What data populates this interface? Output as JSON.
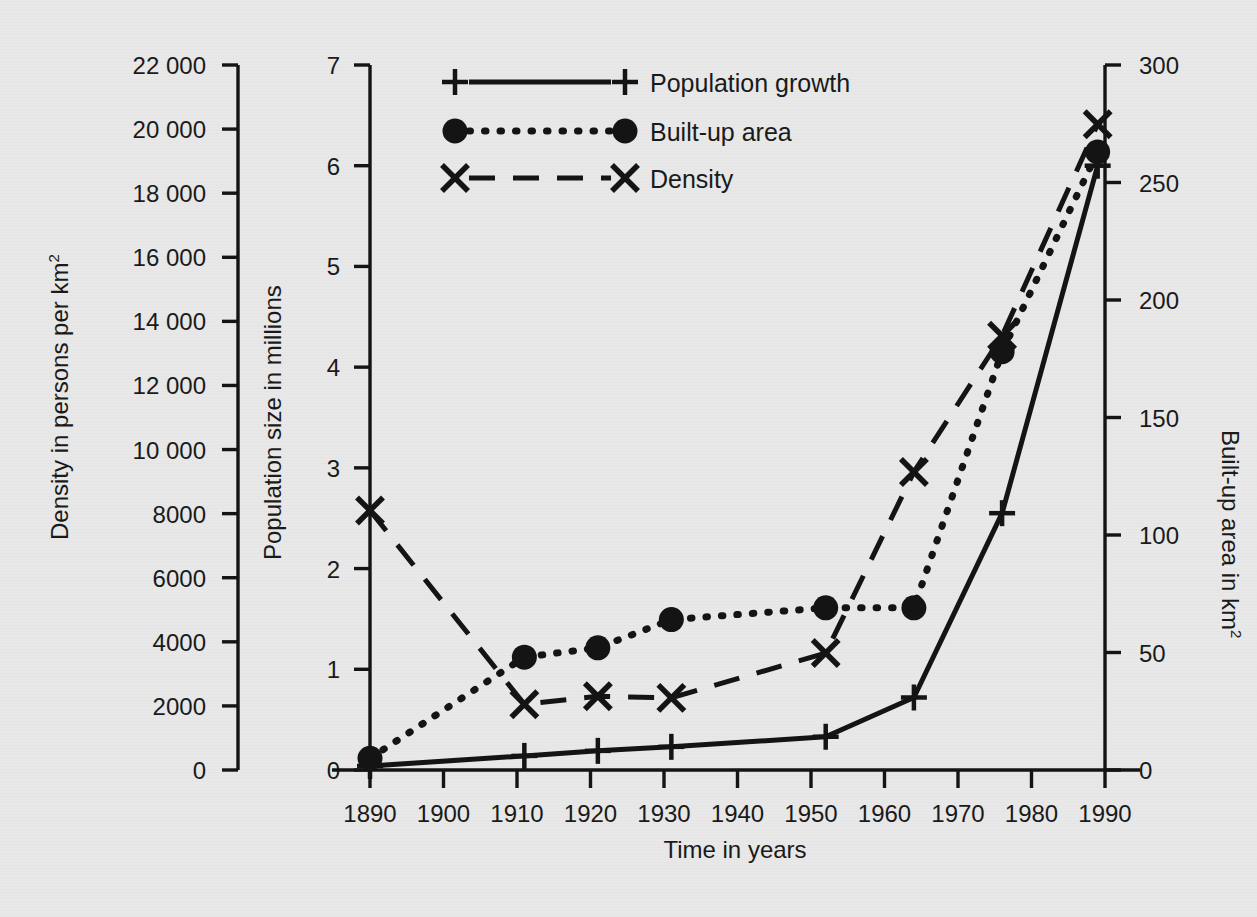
{
  "chart_data": {
    "type": "line",
    "title": "",
    "xlabel": "Time in years",
    "xlim": [
      1890,
      1990
    ],
    "xticks": [
      1890,
      1900,
      1910,
      1920,
      1930,
      1940,
      1950,
      1960,
      1970,
      1980,
      1990
    ],
    "xticklabels": [
      "1890",
      "1900",
      "1910",
      "1920",
      "1930",
      "1940",
      "1950",
      "1960",
      "1970",
      "1980",
      "1990"
    ],
    "grid": false,
    "legend_position": "top-center",
    "axes": [
      {
        "id": "density-axis",
        "position": "outer-left",
        "label_lines": [
          "Density in persons per km"
        ],
        "label_superscript": "2",
        "ylabel": "Density in persons per km²",
        "ylim": [
          0,
          22000
        ],
        "ytick_step": 2000,
        "yticks": [
          0,
          2000,
          4000,
          6000,
          8000,
          10000,
          12000,
          14000,
          16000,
          18000,
          20000,
          22000
        ],
        "yticklabels": [
          "0",
          "2000",
          "4000",
          "6000",
          "8000",
          "10 000",
          "12 000",
          "14 000",
          "16 000",
          "18 000",
          "20 000",
          "22 000"
        ]
      },
      {
        "id": "population-axis",
        "position": "inner-left",
        "ylabel": "Population size in millions",
        "ylim": [
          0,
          7
        ],
        "ytick_step": 1,
        "yticks": [
          0,
          1,
          2,
          3,
          4,
          5,
          6,
          7
        ],
        "yticklabels": [
          "0",
          "1",
          "2",
          "3",
          "4",
          "5",
          "6",
          "7"
        ]
      },
      {
        "id": "builtup-axis",
        "position": "right",
        "label_lines": [
          "Built-up area in km"
        ],
        "label_superscript": "2",
        "ylabel": "Built-up area in km²",
        "ylim": [
          0,
          300
        ],
        "ytick_step": 50,
        "yticks": [
          0,
          50,
          100,
          150,
          200,
          250,
          300
        ],
        "yticklabels": [
          "0",
          "50",
          "100",
          "150",
          "200",
          "250",
          "300"
        ]
      }
    ],
    "series": [
      {
        "name": "Population growth",
        "legend_key": "population-growth",
        "axis": "population-axis",
        "unit": "millions",
        "marker": "plus",
        "linestyle": "solid",
        "color": "#141414",
        "x": [
          1890,
          1911,
          1921,
          1931,
          1952,
          1964,
          1976,
          1989
        ],
        "values": [
          0.04,
          0.14,
          0.19,
          0.23,
          0.33,
          0.72,
          2.55,
          6.0
        ]
      },
      {
        "name": "Built-up area",
        "legend_key": "built-up-area",
        "axis": "builtup-axis",
        "unit": "km²",
        "marker": "circle",
        "linestyle": "dotted",
        "color": "#141414",
        "x": [
          1890,
          1911,
          1921,
          1931,
          1952,
          1964,
          1976,
          1989
        ],
        "values": [
          5,
          48,
          52,
          64,
          69,
          69,
          178,
          263
        ]
      },
      {
        "name": "Density",
        "legend_key": "density",
        "axis": "density-axis",
        "unit": "persons per km²",
        "marker": "cross",
        "linestyle": "dashed",
        "color": "#141414",
        "x": [
          1890,
          1911,
          1921,
          1931,
          1952,
          1964,
          1976,
          1989
        ],
        "values": [
          8100,
          2050,
          2300,
          2250,
          3650,
          9300,
          13550,
          20150
        ]
      }
    ]
  },
  "legend": {
    "entries": [
      {
        "label": "Population growth",
        "marker": "plus",
        "linestyle": "solid"
      },
      {
        "label": "Built-up area",
        "marker": "circle",
        "linestyle": "dotted"
      },
      {
        "label": "Density",
        "marker": "cross",
        "linestyle": "dashed"
      }
    ]
  },
  "colors": {
    "background": "#e8e8e8",
    "ink": "#141414"
  }
}
